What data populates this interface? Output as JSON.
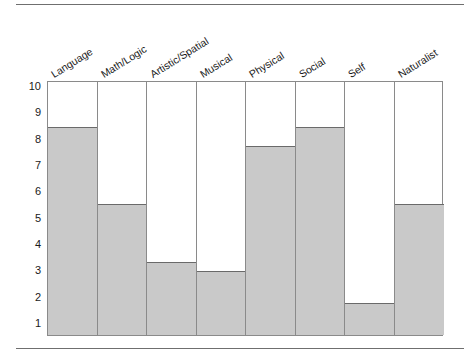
{
  "chart_data": {
    "type": "bar",
    "title": "",
    "subtitle": "",
    "xlabel": "",
    "ylabel": "",
    "ylim": [
      1,
      10
    ],
    "yticks": [
      10,
      9,
      8,
      7,
      6,
      5,
      4,
      3,
      2,
      1
    ],
    "grid": false,
    "legend": "none",
    "orientation": "vertical",
    "bar_fill_color": "#c9c9c9",
    "bar_edge_color": "#6a6a6a",
    "frame_color": "#8a8a8a",
    "categories": [
      "Language",
      "Math/Logic",
      "Artistic/Spatial",
      "Musical",
      "Physical",
      "Social",
      "Self",
      "Naturalist"
    ],
    "values": [
      8.5,
      5.55,
      3.35,
      3.0,
      7.75,
      8.5,
      1.8,
      5.55
    ],
    "series": [
      {
        "name": "Score",
        "values": [
          8.5,
          5.55,
          3.35,
          3.0,
          7.75,
          8.5,
          1.8,
          5.55
        ]
      }
    ]
  },
  "axis": {
    "tick_labels": [
      "10",
      "9",
      "8",
      "7",
      "6",
      "5",
      "4",
      "3",
      "2",
      "1"
    ]
  }
}
